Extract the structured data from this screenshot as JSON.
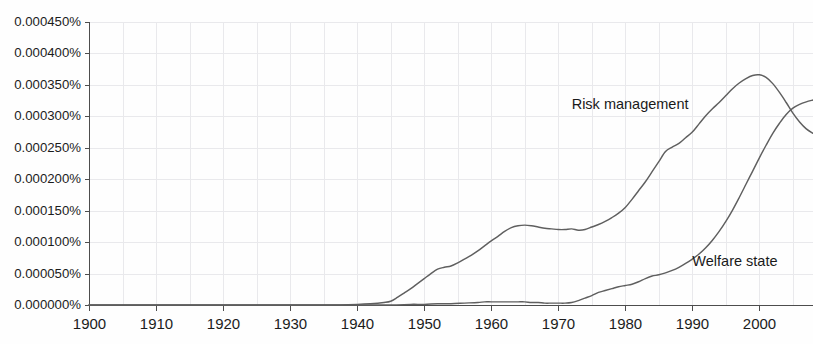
{
  "chart_data": {
    "type": "line",
    "title": "",
    "subtitle": "",
    "xlabel": "",
    "ylabel": "",
    "xlim": [
      1900,
      2008
    ],
    "ylim": [
      0.0,
      0.00045
    ],
    "grid": true,
    "legend_position": "inline-annotation",
    "x_tick_labels": [
      "1900",
      "1910",
      "1920",
      "1930",
      "1940",
      "1950",
      "1960",
      "1970",
      "1980",
      "1990",
      "2000"
    ],
    "x_ticks": [
      1900,
      1910,
      1920,
      1930,
      1940,
      1950,
      1960,
      1970,
      1980,
      1990,
      2000
    ],
    "y_tick_labels": [
      "0.000000%",
      "0.000050%",
      "0.000100%",
      "0.000150%",
      "0.000200%",
      "0.000250%",
      "0.000300%",
      "0.000350%",
      "0.000400%",
      "0.000450%"
    ],
    "y_ticks": [
      0.0,
      5e-05,
      0.0001,
      0.00015,
      0.0002,
      0.00025,
      0.0003,
      0.00035,
      0.0004,
      0.00045
    ],
    "annotations": [
      {
        "text": "Risk management",
        "x": 1972,
        "y": 0.000318
      },
      {
        "text": "Welfare state",
        "x": 1990,
        "y": 6.75e-05
      }
    ],
    "series": [
      {
        "name": "Risk management",
        "color": "#5f5f5f",
        "x": [
          1900,
          1905,
          1910,
          1915,
          1920,
          1925,
          1930,
          1935,
          1940,
          1942,
          1944,
          1945,
          1946,
          1947,
          1948,
          1949,
          1950,
          1951,
          1952,
          1953,
          1954,
          1955,
          1956,
          1957,
          1958,
          1959,
          1960,
          1961,
          1962,
          1963,
          1964,
          1965,
          1966,
          1967,
          1968,
          1969,
          1970,
          1971,
          1972,
          1973,
          1974,
          1975,
          1976,
          1977,
          1978,
          1979,
          1980,
          1981,
          1982,
          1983,
          1984,
          1985,
          1986,
          1987,
          1988,
          1989,
          1990,
          1991,
          1992,
          1993,
          1994,
          1995,
          1996,
          1997,
          1998,
          1999,
          2000,
          2001,
          2002,
          2003,
          2004,
          2005,
          2006,
          2007,
          2008
        ],
        "y": [
          0.0,
          0.0,
          0.0,
          0.0,
          0.0,
          0.0,
          0.0,
          0.0,
          1e-06,
          2e-06,
          4e-06,
          6e-06,
          1.2e-05,
          1.9e-05,
          2.6e-05,
          3.4e-05,
          4.2e-05,
          5e-05,
          5.7e-05,
          6e-05,
          6.2e-05,
          6.7e-05,
          7.3e-05,
          7.9e-05,
          8.6e-05,
          9.4e-05,
          0.000102,
          0.000109,
          0.000117,
          0.000123,
          0.000126,
          0.000127,
          0.000126,
          0.000124,
          0.000122,
          0.000121,
          0.00012,
          0.00012,
          0.000121,
          0.000119,
          0.00012,
          0.000124,
          0.000128,
          0.000133,
          0.000139,
          0.000146,
          0.000155,
          0.000168,
          0.000182,
          0.000196,
          0.000212,
          0.000228,
          0.000244,
          0.000251,
          0.000257,
          0.000266,
          0.000275,
          0.000288,
          0.000301,
          0.000312,
          0.000322,
          0.000333,
          0.000344,
          0.000353,
          0.00036,
          0.000365,
          0.000366,
          0.000362,
          0.000352,
          0.000338,
          0.000322,
          0.000305,
          0.000291,
          0.00028,
          0.000273
        ]
      },
      {
        "name": "Welfare state",
        "color": "#5f5f5f",
        "x": [
          1900,
          1910,
          1920,
          1930,
          1935,
          1940,
          1945,
          1948,
          1950,
          1952,
          1954,
          1956,
          1958,
          1959,
          1960,
          1961,
          1962,
          1963,
          1964,
          1965,
          1966,
          1967,
          1968,
          1969,
          1970,
          1971,
          1972,
          1973,
          1974,
          1975,
          1976,
          1977,
          1978,
          1979,
          1980,
          1981,
          1982,
          1983,
          1984,
          1985,
          1986,
          1987,
          1988,
          1989,
          1990,
          1991,
          1992,
          1993,
          1994,
          1995,
          1996,
          1997,
          1998,
          1999,
          2000,
          2001,
          2002,
          2003,
          2004,
          2005,
          2006,
          2007,
          2008
        ],
        "y": [
          0.0,
          0.0,
          0.0,
          0.0,
          0.0,
          0.0,
          0.0,
          1e-06,
          1e-06,
          2e-06,
          2e-06,
          3e-06,
          4e-06,
          5e-06,
          5e-06,
          5e-06,
          5e-06,
          5e-06,
          5e-06,
          5e-06,
          4e-06,
          4e-06,
          3e-06,
          3e-06,
          3e-06,
          3e-06,
          4e-06,
          7e-06,
          1.1e-05,
          1.5e-05,
          2e-05,
          2.3e-05,
          2.6e-05,
          2.9e-05,
          3.1e-05,
          3.3e-05,
          3.7e-05,
          4.2e-05,
          4.6e-05,
          4.8e-05,
          5.1e-05,
          5.5e-05,
          6e-05,
          6.6e-05,
          7.3e-05,
          8.1e-05,
          9.1e-05,
          0.000103,
          0.000117,
          0.000133,
          0.000151,
          0.000171,
          0.000192,
          0.000213,
          0.000234,
          0.000254,
          0.000273,
          0.000289,
          0.000303,
          0.000313,
          0.000319,
          0.000323,
          0.000326
        ]
      }
    ]
  }
}
